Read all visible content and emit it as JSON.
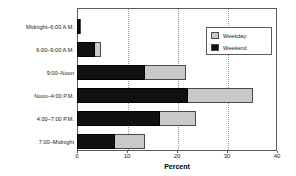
{
  "chart_data": {
    "type": "bar",
    "orientation": "horizontal",
    "stacked": true,
    "title": "",
    "xlabel": "Percent",
    "ylabel": "",
    "xlim": [
      0,
      40
    ],
    "xticks": [
      0,
      10,
      20,
      30,
      40
    ],
    "grid": true,
    "legend_position": "upper right",
    "categories": [
      "Midnight–6:00 A.M.",
      "6:00–9:00 A.M.",
      "9:00–Noon",
      "Noon–4:00 P.M.",
      "4:00–7:00 P.M.",
      "7:00–Midnight"
    ],
    "series": [
      {
        "name": "Weekend",
        "color": "#111111",
        "values": [
          0.5,
          3.6,
          13.6,
          22.2,
          16.6,
          7.6
        ]
      },
      {
        "name": "Weekday",
        "color": "#c9c9c9",
        "values": [
          0.2,
          1.1,
          8.2,
          13.0,
          7.2,
          6.0
        ]
      }
    ]
  },
  "axis": {
    "tick_labels": [
      "0",
      "10",
      "20",
      "30",
      "40"
    ],
    "x_title": "Percent"
  },
  "legend": {
    "items": [
      {
        "label": "Weekday",
        "color": "#c9c9c9"
      },
      {
        "label": "Weekend",
        "color": "#111111"
      }
    ]
  }
}
